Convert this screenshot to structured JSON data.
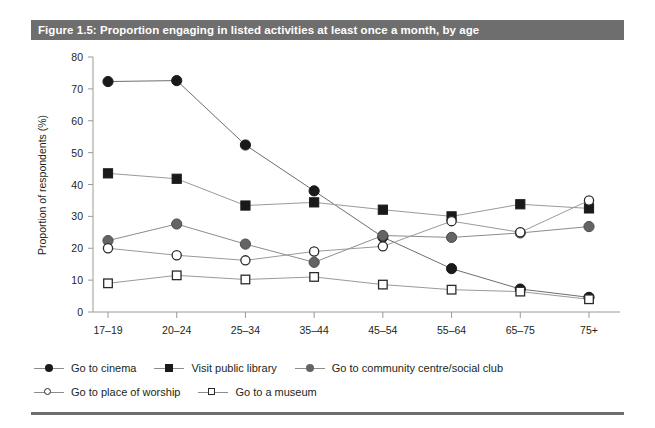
{
  "figure": {
    "title": "Figure 1.5: Proportion engaging in listed activities at least once a month, by age",
    "title_bar_color": "#6e6e6e",
    "background_color": "#ffffff"
  },
  "chart_data": {
    "type": "line",
    "title": "Figure 1.5: Proportion engaging in listed activities at least once a month, by age",
    "xlabel": "",
    "ylabel": "Proportion of respondents (%)",
    "categories": [
      "17–19",
      "20–24",
      "25–34",
      "35–44",
      "45–54",
      "55–64",
      "65–75",
      "75+"
    ],
    "ylim": [
      0,
      80
    ],
    "yticks": [
      0,
      10,
      20,
      30,
      40,
      50,
      60,
      70,
      80
    ],
    "grid": false,
    "legend_position": "bottom-left",
    "series": [
      {
        "name": "Go to cinema",
        "marker": "filled-circle",
        "color": "#1a1a1a",
        "line_color": "#6e6e6e",
        "values": [
          72.3,
          72.6,
          52.4,
          38.0,
          23.5,
          13.6,
          7.2,
          4.6
        ]
      },
      {
        "name": "Visit public library",
        "marker": "filled-square",
        "color": "#1a1a1a",
        "line_color": "#9a9a9a",
        "values": [
          43.5,
          41.8,
          33.4,
          34.4,
          32.1,
          30.0,
          33.8,
          32.5
        ]
      },
      {
        "name": "Go to community centre/social club",
        "marker": "filled-circle-grey",
        "color": "#646464",
        "line_color": "#8c8c8c",
        "values": [
          22.4,
          27.6,
          21.3,
          15.6,
          24.0,
          23.4,
          24.8,
          26.8
        ]
      },
      {
        "name": "Go to place of worship",
        "marker": "open-circle",
        "color": "#ffffff",
        "line_color": "#9a9a9a",
        "values": [
          20.0,
          17.8,
          16.2,
          19.0,
          20.6,
          28.5,
          25.0,
          35.0
        ]
      },
      {
        "name": "Go to a museum",
        "marker": "open-square",
        "color": "#ffffff",
        "line_color": "#9a9a9a",
        "values": [
          9.0,
          11.5,
          10.2,
          11.0,
          8.6,
          7.0,
          6.4,
          4.0
        ]
      }
    ]
  },
  "legend": {
    "row1": [
      {
        "label": "Go to cinema",
        "marker": "filled-circle"
      },
      {
        "label": "Visit public library",
        "marker": "filled-square"
      },
      {
        "label": "Go to community centre/social club",
        "marker": "filled-circle-grey"
      }
    ],
    "row2": [
      {
        "label": "Go to place of worship",
        "marker": "open-circle"
      },
      {
        "label": "Go to a museum",
        "marker": "open-square"
      }
    ]
  }
}
